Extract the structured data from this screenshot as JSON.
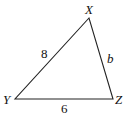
{
  "diagram": {
    "type": "triangle",
    "vertices": {
      "X": {
        "label": "X",
        "x": 89,
        "y": 18
      },
      "Y": {
        "label": "Y",
        "x": 15,
        "y": 99
      },
      "Z": {
        "label": "Z",
        "x": 113,
        "y": 99
      }
    },
    "sides": {
      "XY": {
        "label": "8"
      },
      "XZ": {
        "label": "b"
      },
      "YZ": {
        "label": "6"
      }
    },
    "stroke_color": "#222222"
  }
}
